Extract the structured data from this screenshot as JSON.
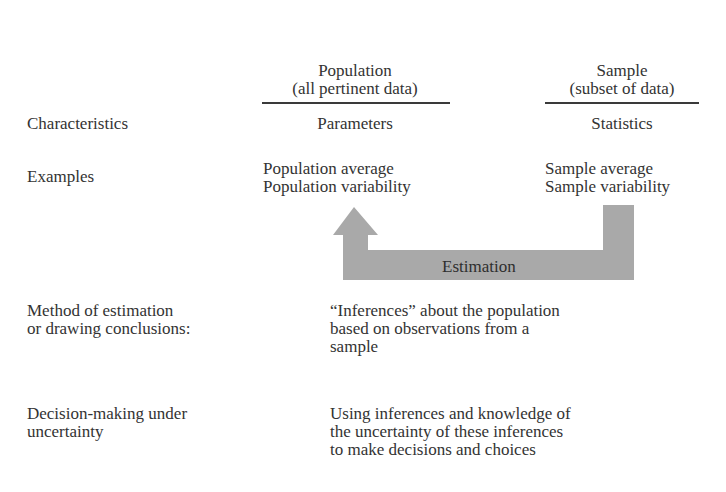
{
  "columns": {
    "population": {
      "title": "Population",
      "subtitle": "(all pertinent data)"
    },
    "sample": {
      "title": "Sample",
      "subtitle": "(subset of data)"
    }
  },
  "rows": {
    "characteristics": {
      "label": "Characteristics",
      "population": "Parameters",
      "sample": "Statistics"
    },
    "examples": {
      "label": "Examples",
      "population": [
        "Population average",
        "Population variability"
      ],
      "sample": [
        "Sample average",
        "Sample variability"
      ]
    },
    "method": {
      "label": [
        "Method of estimation",
        "or drawing conclusions:"
      ],
      "description": [
        "“Inferences” about the population",
        "based on observations from a",
        "sample"
      ]
    },
    "decision": {
      "label": [
        "Decision-making under",
        "uncertainty"
      ],
      "description": [
        "Using inferences and knowledge of",
        "the uncertainty of these inferences",
        "to make decisions and choices"
      ]
    }
  },
  "arrow": {
    "label": "Estimation",
    "from": "sample",
    "to": "population",
    "color": "#a9a9a9"
  }
}
